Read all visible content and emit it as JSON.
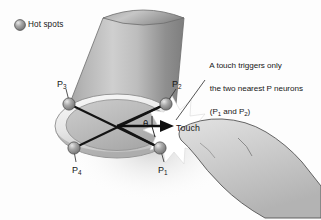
{
  "figure": {
    "title_alt": "Leech body wall with four P neuron hot spots and a touch stimulus",
    "background_color": "#fdfdfd",
    "ink_color": "#171717"
  },
  "legend": {
    "icon": "sphere-icon",
    "label": "Hot spots",
    "swatch_color": "#8e8e8e"
  },
  "annotation": {
    "line1": "A touch triggers only",
    "line2": "the two nearest P neurons",
    "line3_prefix": "(P",
    "line3_sub1": "1",
    "line3_mid": " and P",
    "line3_sub2": "2",
    "line3_suffix": ")"
  },
  "hot_spots": [
    {
      "id": "p3",
      "label_prefix": "P",
      "label_sub": "3",
      "cx": 69,
      "cy": 104,
      "leader_x": 63,
      "leader_y": 87
    },
    {
      "id": "p2",
      "label_prefix": "P",
      "label_sub": "2",
      "cx": 166,
      "cy": 104,
      "leader_x": 177,
      "leader_y": 87
    },
    {
      "id": "p4",
      "label_prefix": "P",
      "label_sub": "4",
      "cx": 74,
      "cy": 148,
      "leader_x": 78,
      "leader_y": 163
    },
    {
      "id": "p1",
      "label_prefix": "P",
      "label_sub": "1",
      "cx": 160,
      "cy": 148,
      "leader_x": 163,
      "leader_y": 163
    }
  ],
  "touch": {
    "label": "Touch",
    "angle_symbol": "θ",
    "starburst_color": "#ffffff",
    "arrow_origin_x": 117,
    "arrow_origin_y": 126,
    "arrow_tip_x": 172,
    "arrow_tip_y": 126
  },
  "body": {
    "shape": "tapered-cylinder",
    "fill_top": "#b9b9b9",
    "fill_bottom": "#8d8d8d",
    "ring_fill": "#efefef",
    "disc_fill": "#bcbcbc"
  },
  "hand": {
    "shape": "pointing-finger",
    "fill": "#cfcfcf",
    "outline": "#4a4a4a"
  }
}
